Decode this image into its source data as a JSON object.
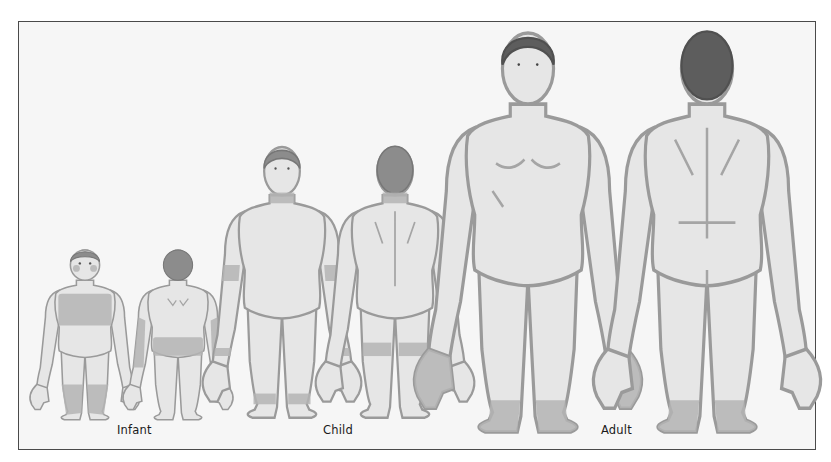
{
  "figure": {
    "groups": [
      {
        "id": "infant",
        "label": "Infant",
        "views": [
          "front",
          "back"
        ],
        "shaded_regions": {
          "front": [
            "cheeks",
            "trunk",
            "lower legs"
          ],
          "back": [
            "scalp",
            "arms (extensor)",
            "buttocks/diaper area"
          ]
        }
      },
      {
        "id": "child",
        "label": "Child",
        "views": [
          "front",
          "back"
        ],
        "shaded_regions": {
          "front": [
            "neck",
            "antecubital fossae",
            "wrists",
            "ankles"
          ],
          "back": [
            "neck",
            "popliteal fossae"
          ]
        }
      },
      {
        "id": "adult",
        "label": "Adult",
        "views": [
          "front",
          "back"
        ],
        "shaded_regions": {
          "front": [
            "hands",
            "feet"
          ],
          "back": [
            "feet"
          ]
        }
      }
    ]
  },
  "colors": {
    "background": "#ffffff",
    "panel": "#f6f6f6",
    "border": "#4a4a4a",
    "skin": "#e6e6e6",
    "outline": "#9a9a9a",
    "shaded": "#b4b4b4",
    "hair": "#8c8c8c",
    "hair_adult": "#5d5d5d"
  }
}
